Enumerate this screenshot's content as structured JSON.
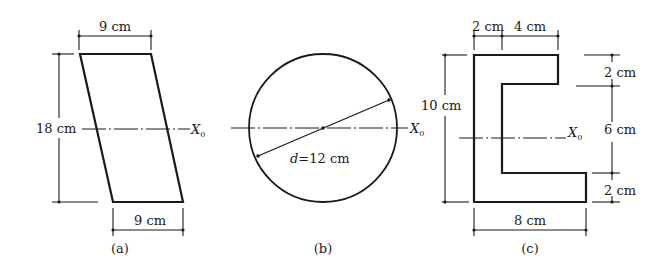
{
  "figure": {
    "panels": [
      {
        "id": "a",
        "caption": "(a)",
        "shape": "parallelogram",
        "dimensions": {
          "top_width": "9 cm",
          "bottom_width": "9 cm",
          "height": "18 cm"
        },
        "axis_label": "X",
        "axis_subscript": "0"
      },
      {
        "id": "b",
        "caption": "(b)",
        "shape": "circle",
        "dimensions": {
          "diameter": "d=12 cm"
        },
        "axis_label": "X",
        "axis_subscript": "0"
      },
      {
        "id": "c",
        "caption": "(c)",
        "shape": "channel (C-section)",
        "dimensions": {
          "top_flange_thickness": "2 cm",
          "top_flange_extension": "4 cm",
          "total_height": "10 cm",
          "upper_flange_depth": "2 cm",
          "web_inner_height": "6 cm",
          "lower_flange_depth": "2 cm",
          "bottom_width": "8 cm"
        },
        "axis_label": "X",
        "axis_subscript": "0"
      }
    ]
  }
}
